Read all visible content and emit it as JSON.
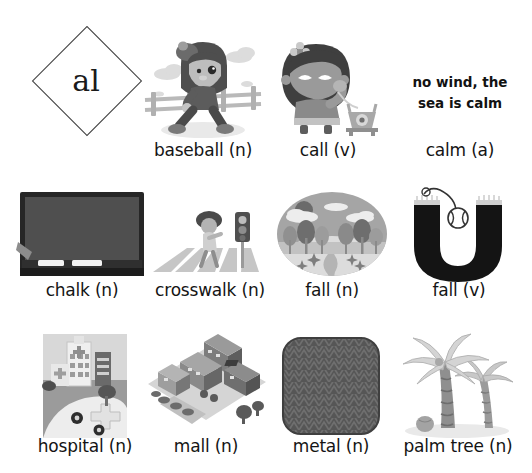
{
  "worksheet": {
    "phoneme": "al",
    "sentence_callout": "no wind, the sea is calm",
    "sentence_line1": "no wind, the",
    "sentence_line2": "sea is calm"
  },
  "colors": {
    "ink": "#141414",
    "outline": "#3b3b3b",
    "paper": "#ffffff",
    "mid_gray": "#8f8f8f",
    "light_gray": "#d2d2d2",
    "dark_gray": "#4a4a4a",
    "board_black": "#2b2b2b"
  },
  "rows": [
    {
      "row_index": 1,
      "items": [
        {
          "id": "phoneme-tile",
          "kind": "phoneme",
          "label": "al",
          "icon": "diamond-phoneme-icon"
        },
        {
          "id": "baseball",
          "label": "baseball (n)",
          "word": "baseball",
          "pos": "(n)",
          "icon": "baseball-batter-icon"
        },
        {
          "id": "call",
          "label": "call (v)",
          "word": "call",
          "pos": "(v)",
          "icon": "girl-on-telephone-icon"
        },
        {
          "id": "calm",
          "label": "calm (a)",
          "word": "calm",
          "pos": "(a)",
          "icon": "calm-sentence-icon"
        }
      ]
    },
    {
      "row_index": 2,
      "items": [
        {
          "id": "chalk",
          "label": "chalk (n)",
          "word": "chalk",
          "pos": "(n)",
          "icon": "chalkboard-icon"
        },
        {
          "id": "crosswalk",
          "label": "crosswalk (n)",
          "word": "crosswalk",
          "pos": "(n)",
          "icon": "crosswalk-icon"
        },
        {
          "id": "fall-n",
          "label": "fall (n)",
          "word": "fall",
          "pos": "(n)",
          "icon": "autumn-landscape-icon"
        },
        {
          "id": "fall-v",
          "label": "fall (v)",
          "word": "fall",
          "pos": "(v)",
          "icon": "ball-falling-in-u-icon"
        }
      ]
    },
    {
      "row_index": 3,
      "items": [
        {
          "id": "hospital",
          "label": "hospital (n)",
          "word": "hospital",
          "pos": "(n)",
          "icon": "hospital-icon"
        },
        {
          "id": "mall",
          "label": "mall (n)",
          "word": "mall",
          "pos": "(n)",
          "icon": "shopping-mall-icon"
        },
        {
          "id": "metal",
          "label": "metal (n)",
          "word": "metal",
          "pos": "(n)",
          "icon": "metal-texture-icon"
        },
        {
          "id": "palm-tree",
          "label": "palm tree (n)",
          "word": "palm tree",
          "pos": "(n)",
          "icon": "palm-tree-icon"
        }
      ]
    }
  ]
}
